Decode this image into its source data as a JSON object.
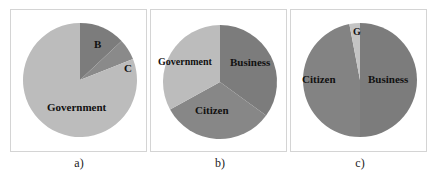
{
  "chart_data": [
    {
      "type": "pie",
      "caption": "a)",
      "categories": [
        "B",
        "C",
        "Government"
      ],
      "values": [
        13,
        6,
        81
      ],
      "colors": [
        "#7c7c7c",
        "#8a8a8a",
        "#bcbcbc"
      ],
      "start_angle_deg": 0,
      "direction": "clockwise"
    },
    {
      "type": "pie",
      "caption": "b)",
      "categories": [
        "Business",
        "Citizen",
        "Government"
      ],
      "values": [
        35,
        32,
        33
      ],
      "colors": [
        "#7c7c7c",
        "#878787",
        "#bcbcbc"
      ],
      "start_angle_deg": 0,
      "direction": "clockwise"
    },
    {
      "type": "pie",
      "caption": "c)",
      "categories": [
        "Business",
        "Citizen",
        "G"
      ],
      "values": [
        50,
        47,
        3
      ],
      "colors": [
        "#7c7c7c",
        "#838383",
        "#c4c4c4"
      ],
      "start_angle_deg": 0,
      "direction": "clockwise"
    }
  ],
  "captions": [
    "a)",
    "b)",
    "c)"
  ]
}
